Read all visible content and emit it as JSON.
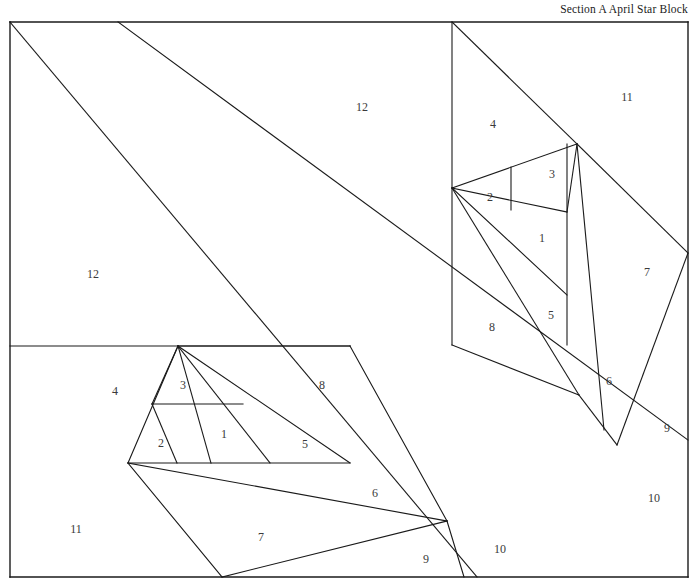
{
  "document": {
    "title": "Section A April Star Block",
    "type": "foundation-paper-piecing-pattern",
    "background_color": "#ffffff",
    "line_color": "#1a1a1a",
    "label_color": "#3a3a3a",
    "width": 700,
    "height": 584
  },
  "labels": [
    {
      "id": "label-12-top",
      "text": "12",
      "x": 362,
      "y": 107
    },
    {
      "id": "label-12-left",
      "text": "12",
      "x": 93,
      "y": 274
    },
    {
      "id": "label-11-right",
      "text": "11",
      "x": 627,
      "y": 97
    },
    {
      "id": "label-4-right",
      "text": "4",
      "x": 493,
      "y": 124
    },
    {
      "id": "label-2-right",
      "text": "2",
      "x": 490,
      "y": 197
    },
    {
      "id": "label-3-right",
      "text": "3",
      "x": 552,
      "y": 174
    },
    {
      "id": "label-1-right",
      "text": "1",
      "x": 542,
      "y": 238
    },
    {
      "id": "label-5-right",
      "text": "5",
      "x": 551,
      "y": 315
    },
    {
      "id": "label-8-right",
      "text": "8",
      "x": 492,
      "y": 327
    },
    {
      "id": "label-7-right",
      "text": "7",
      "x": 647,
      "y": 272
    },
    {
      "id": "label-6-right",
      "text": "6",
      "x": 609,
      "y": 381
    },
    {
      "id": "label-9-right",
      "text": "9",
      "x": 667,
      "y": 428
    },
    {
      "id": "label-10-right",
      "text": "10",
      "x": 654,
      "y": 498
    },
    {
      "id": "label-4-left",
      "text": "4",
      "x": 115,
      "y": 391
    },
    {
      "id": "label-3-left",
      "text": "3",
      "x": 183,
      "y": 385
    },
    {
      "id": "label-2-left",
      "text": "2",
      "x": 161,
      "y": 443
    },
    {
      "id": "label-1-left",
      "text": "1",
      "x": 224,
      "y": 434
    },
    {
      "id": "label-5-left",
      "text": "5",
      "x": 305,
      "y": 444
    },
    {
      "id": "label-8-left",
      "text": "8",
      "x": 322,
      "y": 385
    },
    {
      "id": "label-11-left",
      "text": "11",
      "x": 76,
      "y": 529
    },
    {
      "id": "label-7-left",
      "text": "7",
      "x": 261,
      "y": 537
    },
    {
      "id": "label-6-left",
      "text": "6",
      "x": 375,
      "y": 493
    },
    {
      "id": "label-9-left",
      "text": "9",
      "x": 426,
      "y": 559
    },
    {
      "id": "label-10-left",
      "text": "10",
      "x": 500,
      "y": 549
    }
  ],
  "geometry": {
    "border": [
      {
        "name": "border-top-left-segment",
        "x1": 10,
        "y1": 22,
        "x2": 688,
        "y2": 22
      },
      {
        "name": "border-left",
        "x1": 10,
        "y1": 22,
        "x2": 10,
        "y2": 577
      },
      {
        "name": "border-bottom",
        "x1": 10,
        "y1": 577,
        "x2": 688,
        "y2": 577
      },
      {
        "name": "border-right",
        "x1": 688,
        "y1": 22,
        "x2": 688,
        "y2": 577
      }
    ],
    "diagonals": [
      {
        "name": "main-diagonal-upper",
        "x1": 118,
        "y1": 22,
        "x2": 688,
        "y2": 440
      },
      {
        "name": "main-diagonal-lower",
        "x1": 10,
        "y1": 22,
        "x2": 477,
        "y2": 577
      }
    ],
    "section_right": [
      {
        "name": "r-vertical-left",
        "x1": 452,
        "y1": 22,
        "x2": 452,
        "y2": 345
      },
      {
        "name": "r-hypotenuse-4",
        "x1": 452,
        "y1": 22,
        "x2": 577,
        "y2": 144
      },
      {
        "name": "r-edge-2-top",
        "x1": 452,
        "y1": 188,
        "x2": 577,
        "y2": 144
      },
      {
        "name": "r-vertical-mid",
        "x1": 511,
        "y1": 167,
        "x2": 511,
        "y2": 210
      },
      {
        "name": "r-seam-3",
        "x1": 577,
        "y1": 144,
        "x2": 567,
        "y2": 212
      },
      {
        "name": "r-vertical-right",
        "x1": 567,
        "y1": 144,
        "x2": 567,
        "y2": 345
      },
      {
        "name": "r-seam-1",
        "x1": 452,
        "y1": 188,
        "x2": 567,
        "y2": 212
      },
      {
        "name": "r-seam-5",
        "x1": 452,
        "y1": 188,
        "x2": 567,
        "y2": 295
      },
      {
        "name": "r-seam-8",
        "x1": 452,
        "y1": 188,
        "x2": 579,
        "y2": 395
      },
      {
        "name": "r-seam-6",
        "x1": 577,
        "y1": 144,
        "x2": 604,
        "y2": 430
      },
      {
        "name": "r-seam-7",
        "x1": 577,
        "y1": 144,
        "x2": 688,
        "y2": 253
      },
      {
        "name": "r-seam-9",
        "x1": 688,
        "y1": 253,
        "x2": 617,
        "y2": 445
      },
      {
        "name": "r-base-6",
        "x1": 579,
        "y1": 395,
        "x2": 617,
        "y2": 445
      },
      {
        "name": "r-base-left",
        "x1": 452,
        "y1": 345,
        "x2": 579,
        "y2": 395
      }
    ],
    "section_left": [
      {
        "name": "l-horizontal-top",
        "x1": 10,
        "y1": 346,
        "x2": 350,
        "y2": 346
      },
      {
        "name": "l-star-top",
        "x1": 178,
        "y1": 346,
        "x2": 350,
        "y2": 346
      },
      {
        "name": "l-edge-4",
        "x1": 178,
        "y1": 346,
        "x2": 128,
        "y2": 463
      },
      {
        "name": "l-vertical-mid",
        "x1": 152,
        "y1": 404,
        "x2": 243,
        "y2": 404
      },
      {
        "name": "l-seam-3",
        "x1": 178,
        "y1": 346,
        "x2": 152,
        "y2": 404
      },
      {
        "name": "l-seam-1",
        "x1": 178,
        "y1": 346,
        "x2": 211,
        "y2": 463
      },
      {
        "name": "l-seam-5",
        "x1": 178,
        "y1": 346,
        "x2": 270,
        "y2": 463
      },
      {
        "name": "l-seam-8",
        "x1": 178,
        "y1": 346,
        "x2": 350,
        "y2": 463
      },
      {
        "name": "l-base",
        "x1": 128,
        "y1": 463,
        "x2": 350,
        "y2": 463
      },
      {
        "name": "l-seam-2",
        "x1": 152,
        "y1": 404,
        "x2": 177,
        "y2": 463
      },
      {
        "name": "l-seam-6",
        "x1": 350,
        "y1": 346,
        "x2": 447,
        "y2": 521
      },
      {
        "name": "l-seam-7",
        "x1": 128,
        "y1": 463,
        "x2": 447,
        "y2": 521
      },
      {
        "name": "l-seam-9a",
        "x1": 128,
        "y1": 463,
        "x2": 222,
        "y2": 577
      },
      {
        "name": "l-seam-9b",
        "x1": 222,
        "y1": 577,
        "x2": 447,
        "y2": 521
      },
      {
        "name": "l-seam-10",
        "x1": 447,
        "y1": 521,
        "x2": 464,
        "y2": 577
      }
    ]
  }
}
